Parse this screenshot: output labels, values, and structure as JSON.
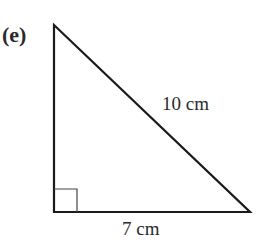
{
  "diagram": {
    "part_label": "(e)",
    "type": "right-angled triangle",
    "hypotenuse_label": "10 cm",
    "base_label": "7 cm",
    "right_angle_marker": "bottom-left",
    "colors": {
      "stroke": "#1a1a1a",
      "text": "#2a2a2a",
      "background": "#ffffff"
    }
  }
}
